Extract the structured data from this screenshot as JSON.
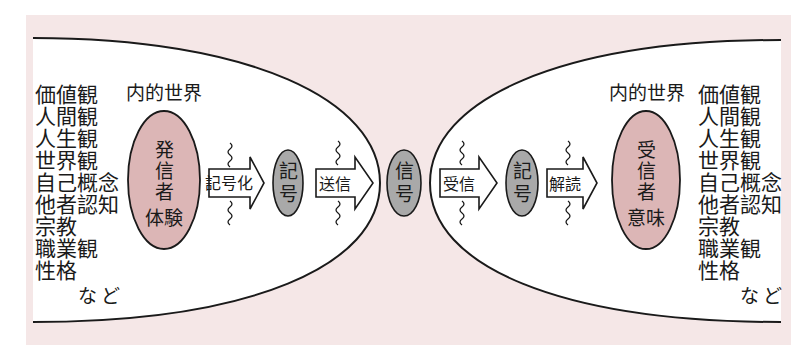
{
  "colors": {
    "background": "#ffffff",
    "panel": "#f5e7e7",
    "inner_world": "#ffffff",
    "person_oval": "#dcb6b6",
    "signal_oval": "#a9a9a9",
    "stroke": "#1a1a1a"
  },
  "sender": {
    "heading": "内的世界",
    "attributes": [
      "価値観",
      "人間観",
      "人生観",
      "世界観",
      "自己概念",
      "他者認知",
      "宗教",
      "職業観",
      "性格"
    ],
    "etc": "など",
    "oval": {
      "line1": "発",
      "line2": "信",
      "line3": "者",
      "sub": "体験"
    }
  },
  "receiver": {
    "heading": "内的世界",
    "attributes": [
      "価値観",
      "人間観",
      "人生観",
      "世界観",
      "自己概念",
      "他者認知",
      "宗教",
      "職業観",
      "性格"
    ],
    "etc": "など",
    "oval": {
      "line1": "受",
      "line2": "信",
      "line3": "者",
      "sub": "意味"
    }
  },
  "flow": {
    "encode_arrow": "記号化",
    "sender_symbol": {
      "line1": "記",
      "line2": "号"
    },
    "send_arrow": "送信",
    "signal": {
      "line1": "信",
      "line2": "号"
    },
    "receive_arrow": "受信",
    "receiver_symbol": {
      "line1": "記",
      "line2": "号"
    },
    "decode_arrow": "解読"
  },
  "icons": {
    "noise": "wavy-noise-line"
  }
}
